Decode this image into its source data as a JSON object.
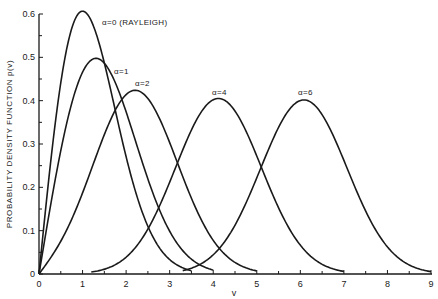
{
  "chart_data": {
    "type": "line",
    "title": "",
    "xlabel": "v",
    "ylabel": "PROBABILITY DENSITY FUNCTION p(v)",
    "xlim": [
      0,
      9
    ],
    "ylim": [
      0,
      0.6
    ],
    "x_ticks": [
      "0",
      "1",
      "2",
      "3",
      "4",
      "5",
      "6",
      "7",
      "8",
      "9"
    ],
    "y_ticks": [
      "0",
      "0.1",
      "0.2",
      "0.3",
      "0.4",
      "0.5",
      "0.6"
    ],
    "grid": false,
    "legend": "inline curve labels",
    "series": [
      {
        "name": "α=0 (RAYLEIGH)",
        "alpha": 0,
        "v_range": [
          0,
          3.5
        ],
        "peak": {
          "v": 1.0,
          "p": 0.607
        },
        "x": [
          0,
          0.5,
          1.0,
          1.5,
          2.0,
          2.5,
          3.0,
          3.5
        ],
        "values": [
          0,
          0.44,
          0.607,
          0.49,
          0.27,
          0.11,
          0.033,
          0.008
        ]
      },
      {
        "name": "α=1",
        "alpha": 1,
        "v_range": [
          0,
          4.0
        ],
        "peak": {
          "v": 1.4,
          "p": 0.5
        },
        "x": [
          0,
          0.5,
          1.0,
          1.5,
          2.0,
          2.5,
          3.0,
          3.5,
          4.0
        ],
        "values": [
          0,
          0.28,
          0.46,
          0.49,
          0.39,
          0.23,
          0.1,
          0.035,
          0.01
        ]
      },
      {
        "name": "α=2",
        "alpha": 2,
        "v_range": [
          0,
          5.0
        ],
        "peak": {
          "v": 2.3,
          "p": 0.42
        },
        "x": [
          0,
          1.0,
          1.5,
          2.0,
          2.5,
          3.0,
          3.5,
          4.0,
          4.5,
          5.0
        ],
        "values": [
          0,
          0.17,
          0.3,
          0.4,
          0.41,
          0.33,
          0.21,
          0.11,
          0.04,
          0.01
        ]
      },
      {
        "name": "α=4",
        "alpha": 4,
        "v_range": [
          1.2,
          7.0
        ],
        "peak": {
          "v": 4.1,
          "p": 0.4
        },
        "x": [
          1.2,
          2.0,
          2.5,
          3.0,
          3.5,
          4.0,
          4.5,
          5.0,
          5.5,
          6.0,
          7.0
        ],
        "values": [
          0.005,
          0.05,
          0.11,
          0.22,
          0.33,
          0.4,
          0.37,
          0.27,
          0.15,
          0.07,
          0.005
        ]
      },
      {
        "name": "α=6",
        "alpha": 6,
        "v_range": [
          3.3,
          9.0
        ],
        "peak": {
          "v": 6.1,
          "p": 0.4
        },
        "x": [
          3.3,
          4.0,
          4.5,
          5.0,
          5.5,
          6.0,
          6.5,
          7.0,
          7.5,
          8.0,
          9.0
        ],
        "values": [
          0.005,
          0.05,
          0.11,
          0.22,
          0.33,
          0.4,
          0.37,
          0.27,
          0.15,
          0.07,
          0.004
        ]
      }
    ],
    "annotations": [
      {
        "text": "α=0 (RAYLEIGH)",
        "x": 1.45,
        "y": 0.585
      },
      {
        "text": "α=1",
        "x": 1.75,
        "y": 0.465
      },
      {
        "text": "α=2",
        "x": 2.2,
        "y": 0.44
      },
      {
        "text": "α=4",
        "x": 3.95,
        "y": 0.42
      },
      {
        "text": "α=6",
        "x": 5.95,
        "y": 0.42
      }
    ]
  },
  "labels": {
    "curve_a0": "α=0 (RAYLEIGH)",
    "curve_a1": "α=1",
    "curve_a2": "α=2",
    "curve_a4": "α=4",
    "curve_a6": "α=6",
    "xlabel": "v",
    "ylabel": "PROBABILITY DENSITY FUNCTION p(v)"
  }
}
